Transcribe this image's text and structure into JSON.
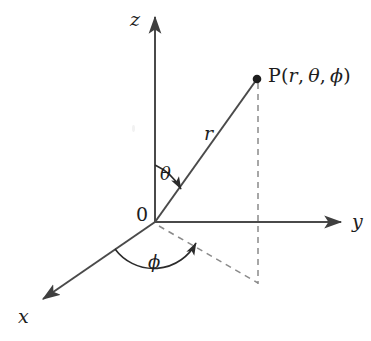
{
  "figure": {
    "type": "spherical-coordinate-diagram",
    "background_color": "#ffffff",
    "stroke_color": "#4a4a4a",
    "text_color": "#1d1d1d",
    "dash_color": "#8a8a8a"
  },
  "labels": {
    "z_axis": "z",
    "y_axis": "y",
    "x_axis": "x",
    "origin": "0",
    "radius": "r",
    "polar_angle": "θ",
    "azimuth_angle": "ϕ",
    "point_prefix": "P",
    "point_open": "(",
    "point_r": "r",
    "point_comma1": ",",
    "point_theta": "θ",
    "point_comma2": ",",
    "point_phi": "ϕ",
    "point_close": ")",
    "point_full": "P(r, θ, ϕ)"
  },
  "geometry": {
    "origin": {
      "x": 155,
      "y": 222
    },
    "z_axis_tip": {
      "x": 155,
      "y": 13
    },
    "y_axis_tip": {
      "x": 345,
      "y": 222
    },
    "x_axis_tip": {
      "x": 38,
      "y": 303
    },
    "point_P": {
      "x": 257,
      "y": 79
    },
    "projection_xy": {
      "x": 258,
      "y": 283
    },
    "theta_arc_from": "z-axis",
    "theta_arc_to": "radius-line",
    "phi_arc_from": "x-axis",
    "phi_arc_to": "projection-line"
  }
}
